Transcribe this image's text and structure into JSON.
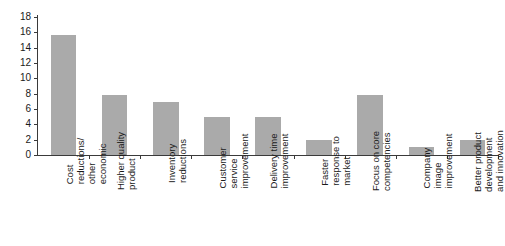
{
  "chart_data": {
    "type": "bar",
    "title": "",
    "subtitle": "",
    "xlabel": "",
    "ylabel": "",
    "ylim": [
      0,
      18
    ],
    "ytick_step": 2,
    "yticks": [
      0,
      2,
      4,
      6,
      8,
      10,
      12,
      14,
      16,
      18
    ],
    "grid": false,
    "legend": null,
    "bar_color": "#aaaaaa",
    "axis_color": "#3a3a3a",
    "text_color": "#1a1a1a",
    "background": "#ffffff",
    "label_rotation_degrees": 90,
    "categories": [
      "Cost reductions/ other economic",
      "Higher quality product",
      "Inventory reductions",
      "Customer service improvement",
      "Delivery time improvement",
      "Faster response to market",
      "Focus on core competencies",
      "Company image improvement",
      "Better product development and innovation"
    ],
    "category_lines": [
      [
        "Cost",
        "reductions/",
        "other",
        "economic"
      ],
      [
        "Higher quality",
        "product"
      ],
      [
        "Inventory",
        "reductions"
      ],
      [
        "Customer",
        "service",
        "improvement"
      ],
      [
        "Delivery time",
        "improvement"
      ],
      [
        "Faster",
        "response to",
        "market"
      ],
      [
        "Focus on core",
        "competencies"
      ],
      [
        "Company",
        "image",
        "improvement"
      ],
      [
        "Better product",
        "development",
        "and innovation"
      ]
    ],
    "values": [
      15.6,
      7.8,
      6.9,
      5.0,
      5.0,
      1.9,
      7.8,
      1.0,
      2.0
    ]
  }
}
